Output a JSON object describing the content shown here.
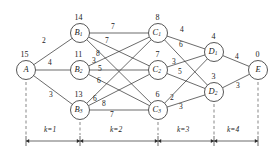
{
  "figure": {
    "type": "shortest-path-network-diagram",
    "node_label_meaning": "value-above-node",
    "stage_axis_label": "k"
  },
  "nodes": [
    {
      "id": "A",
      "name": "A",
      "sub": "",
      "value": "15",
      "x": 26,
      "y": 70
    },
    {
      "id": "B1",
      "name": "B",
      "sub": "1",
      "value": "14",
      "x": 80,
      "y": 33
    },
    {
      "id": "B2",
      "name": "B",
      "sub": "2",
      "value": "11",
      "x": 80,
      "y": 70
    },
    {
      "id": "B3",
      "name": "B",
      "sub": "3",
      "value": "13",
      "x": 80,
      "y": 110
    },
    {
      "id": "C1",
      "name": "C",
      "sub": "1",
      "value": "8",
      "x": 158,
      "y": 33
    },
    {
      "id": "C2",
      "name": "C",
      "sub": "2",
      "value": "7",
      "x": 158,
      "y": 70
    },
    {
      "id": "C3",
      "name": "C",
      "sub": "3",
      "value": "6",
      "x": 158,
      "y": 110
    },
    {
      "id": "D1",
      "name": "D",
      "sub": "1",
      "value": "4",
      "x": 214,
      "y": 52
    },
    {
      "id": "D2",
      "name": "D",
      "sub": "2",
      "value": "3",
      "x": 214,
      "y": 92
    },
    {
      "id": "E",
      "name": "E",
      "sub": "",
      "value": "0",
      "x": 258,
      "y": 70
    }
  ],
  "edges": [
    {
      "from": "A",
      "to": "B1",
      "weight": "2",
      "lx": 44,
      "ly": 41
    },
    {
      "from": "A",
      "to": "B2",
      "weight": "4",
      "lx": 50,
      "ly": 63
    },
    {
      "from": "A",
      "to": "B3",
      "weight": "3",
      "lx": 51,
      "ly": 95
    },
    {
      "from": "B1",
      "to": "C1",
      "weight": "7",
      "lx": 113,
      "ly": 27
    },
    {
      "from": "B1",
      "to": "C2",
      "weight": "7",
      "lx": 107,
      "ly": 41
    },
    {
      "from": "B1",
      "to": "C3",
      "weight": "8",
      "lx": 98,
      "ly": 54
    },
    {
      "from": "B2",
      "to": "C1",
      "weight": "3",
      "lx": 94,
      "ly": 61
    },
    {
      "from": "B2",
      "to": "C2",
      "weight": "5",
      "lx": 100,
      "ly": 69
    },
    {
      "from": "B2",
      "to": "C3",
      "weight": "6",
      "lx": 99,
      "ly": 81
    },
    {
      "from": "B3",
      "to": "C1",
      "weight": "6",
      "lx": 95,
      "ly": 99
    },
    {
      "from": "B3",
      "to": "C2",
      "weight": "8",
      "lx": 104,
      "ly": 104
    },
    {
      "from": "B3",
      "to": "C3",
      "weight": "7",
      "lx": 112,
      "ly": 115
    },
    {
      "from": "C1",
      "to": "D1",
      "weight": "4",
      "lx": 182,
      "ly": 30
    },
    {
      "from": "C1",
      "to": "D2",
      "weight": "6",
      "lx": 181,
      "ly": 45
    },
    {
      "from": "C2",
      "to": "D1",
      "weight": "3",
      "lx": 174,
      "ly": 62
    },
    {
      "from": "C2",
      "to": "D2",
      "weight": "5",
      "lx": 180,
      "ly": 72
    },
    {
      "from": "C3",
      "to": "D1",
      "weight": "2",
      "lx": 172,
      "ly": 98
    },
    {
      "from": "C3",
      "to": "D2",
      "weight": "3",
      "lx": 181,
      "ly": 107
    },
    {
      "from": "D1",
      "to": "E",
      "weight": "4",
      "lx": 237,
      "ly": 57
    },
    {
      "from": "D2",
      "to": "E",
      "weight": "3",
      "lx": 238,
      "ly": 86
    }
  ],
  "stage_axis": {
    "ticks_x": [
      26,
      80,
      158,
      214,
      258
    ],
    "segments": [
      {
        "label": "k=1",
        "cx": 53
      },
      {
        "label": "k=2",
        "cx": 119
      },
      {
        "label": "k=3",
        "cx": 186
      },
      {
        "label": "k=4",
        "cx": 236
      }
    ]
  },
  "colors": {
    "stroke": "#2b2b2b",
    "text": "#1a1a1a",
    "dashed": "#444444",
    "background": "#ffffff"
  }
}
